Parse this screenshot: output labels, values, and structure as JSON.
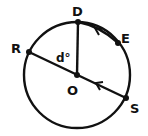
{
  "diagram": {
    "type": "circle-geometry",
    "stroke_color": "#111111",
    "background": "#ffffff",
    "circle": {
      "center_label": "O",
      "cx": 77,
      "cy": 75,
      "r": 53
    },
    "points": {
      "D": {
        "label": "D",
        "x": 78,
        "y": 22
      },
      "E": {
        "label": "E",
        "x": 118,
        "y": 43
      },
      "R": {
        "label": "R",
        "x": 29,
        "y": 52
      },
      "S": {
        "label": "S",
        "x": 126,
        "y": 98
      },
      "O": {
        "label": "O",
        "x": 77,
        "y": 75
      }
    },
    "segments": [
      {
        "from": "R",
        "to": "S",
        "note": "diameter through O, arrow mark"
      },
      {
        "from": "O",
        "to": "D",
        "note": "radius"
      },
      {
        "from": "D",
        "to": "E",
        "note": "chord, arrow mark (parallel to RS)"
      }
    ],
    "angle_label": "d°"
  }
}
